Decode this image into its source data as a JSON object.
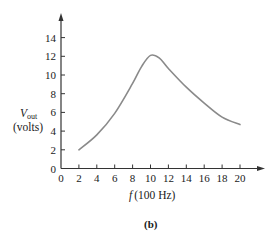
{
  "chart_data": {
    "type": "line",
    "title": "",
    "caption": "(b)",
    "xlabel": "f (100 Hz)",
    "xlabel_italic_part": "f",
    "xlabel_unit": "(100 Hz)",
    "ylabel": "V_out (volts)",
    "ylabel_symbol": "V",
    "ylabel_subscript": "out",
    "ylabel_unit": "(volts)",
    "xlim": [
      0,
      22
    ],
    "ylim": [
      0,
      16
    ],
    "xticks": [
      0,
      2,
      4,
      6,
      8,
      10,
      12,
      14,
      16,
      18,
      20
    ],
    "yticks": [
      0,
      2,
      4,
      6,
      8,
      10,
      12,
      14
    ],
    "grid": false,
    "legend": null,
    "series": [
      {
        "name": "V_out",
        "color": "#8a8a8a",
        "x": [
          2,
          4,
          6,
          8,
          9,
          10,
          11,
          12,
          14,
          16,
          18,
          20
        ],
        "y": [
          2.0,
          3.6,
          5.9,
          9.1,
          10.9,
          12.1,
          11.8,
          10.7,
          8.7,
          7.0,
          5.5,
          4.7
        ]
      }
    ]
  }
}
